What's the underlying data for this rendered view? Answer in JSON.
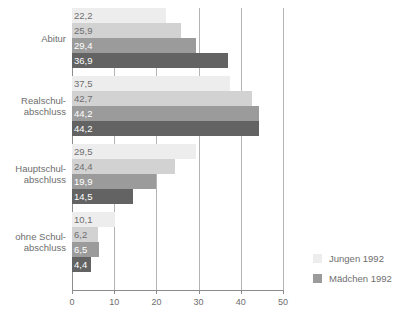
{
  "chart_data": {
    "type": "bar",
    "orientation": "horizontal",
    "title": "",
    "xlabel": "",
    "ylabel": "",
    "xlim": [
      0,
      50
    ],
    "xticks": [
      "0",
      "10",
      "20",
      "30",
      "40",
      "50"
    ],
    "grid": true,
    "legend_position": "right",
    "categories": [
      "Abitur",
      "Realschul-\nabschluss",
      "Hauptschul-\nabschluss",
      "ohne Schul-\nabschluss"
    ],
    "category_lines": [
      [
        "Abitur"
      ],
      [
        "Realschul-",
        "abschluss"
      ],
      [
        "Hauptschul-",
        "abschluss"
      ],
      [
        "ohne Schul-",
        "abschluss"
      ]
    ],
    "series": [
      {
        "name": "Jungen 1992",
        "color": "#ededed",
        "label_color": "#6e6e6e",
        "values": [
          22.2,
          37.5,
          29.5,
          10.1
        ],
        "labels": [
          "22,2",
          "37,5",
          "29,5",
          "10,1"
        ]
      },
      {
        "name": "",
        "color": "#d2d2d2",
        "label_color": "#6e6e6e",
        "values": [
          25.9,
          42.7,
          24.4,
          6.2
        ],
        "labels": [
          "25,9",
          "42,7",
          "24,4",
          "6,2"
        ]
      },
      {
        "name": "Mädchen 1992",
        "color": "#9b9b9b",
        "label_color": "#ffffff",
        "values": [
          29.4,
          44.2,
          19.9,
          6.5
        ],
        "labels": [
          "29,4",
          "44,2",
          "19,9",
          "6,5"
        ]
      },
      {
        "name": "",
        "color": "#636363",
        "label_color": "#ffffff",
        "values": [
          36.9,
          44.2,
          14.5,
          4.4
        ],
        "labels": [
          "36,9",
          "44,2",
          "14,5",
          "4,4"
        ]
      }
    ]
  },
  "legend": {
    "items": [
      {
        "label": "Jungen 1992",
        "color": "#ededed"
      },
      {
        "label": "Mädchen 1992",
        "color": "#9b9b9b"
      }
    ]
  },
  "axis": {
    "tick_labels": [
      "0",
      "10",
      "20",
      "30",
      "40",
      "50"
    ],
    "tick_values": [
      0,
      10,
      20,
      30,
      40,
      50
    ]
  }
}
